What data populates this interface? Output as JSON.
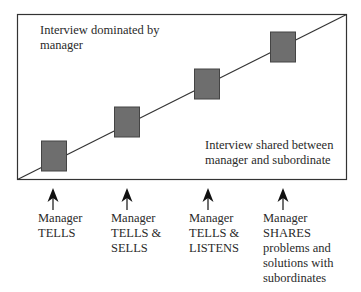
{
  "diagram": {
    "top_label": "Interview dominated by manager",
    "bottom_label": "Interview shared between manager and subordinate",
    "colors": {
      "box_fill": "#6e6e6e",
      "line": "#333333",
      "background": "#ffffff"
    },
    "styles": [
      {
        "label": "Manager\nTELLS",
        "icon": "arrow-up-icon"
      },
      {
        "label": "Manager\nTELLS &\nSELLS",
        "icon": "arrow-up-icon"
      },
      {
        "label": "Manager\nTELLS &\nLISTENS",
        "icon": "arrow-up-icon"
      },
      {
        "label": "Manager\nSHARES\nproblems and\nsolutions with\nsubordinates",
        "icon": "arrow-up-icon"
      }
    ]
  }
}
